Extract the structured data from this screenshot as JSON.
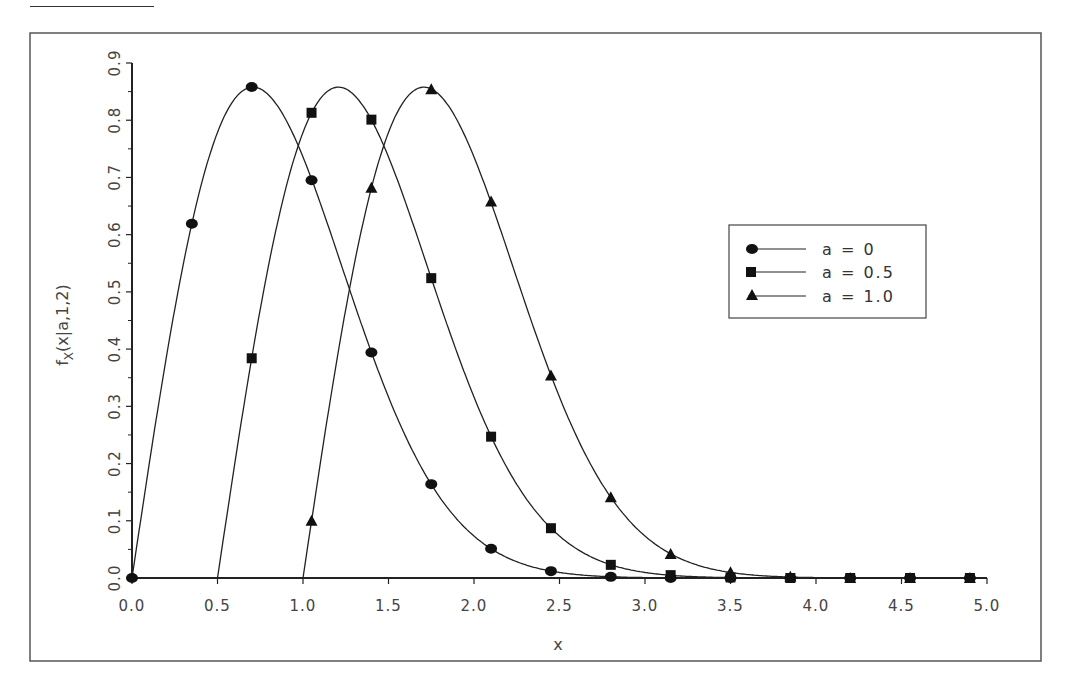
{
  "page": {
    "top_fragments": [
      "g",
      "g",
      "p"
    ]
  },
  "chart_data": {
    "type": "line",
    "title": "",
    "xlabel": "x",
    "ylabel": "f_X(x|a,1,2)",
    "ylabel_main": "f",
    "ylabel_sub": "X",
    "ylabel_rest": "(x|a,1,2)",
    "xlim": [
      0.0,
      5.0
    ],
    "ylim": [
      0.0,
      0.9
    ],
    "xticks": [
      "0.0",
      "0.5",
      "1.0",
      "1.5",
      "2.0",
      "2.5",
      "3.0",
      "3.5",
      "4.0",
      "4.5",
      "5.0"
    ],
    "yticks": [
      "0.0",
      "0.1",
      "0.2",
      "0.3",
      "0.4",
      "0.5",
      "0.6",
      "0.7",
      "0.8",
      "0.9"
    ],
    "grid": false,
    "legend_position": "right-center",
    "x": [
      0.0,
      0.35,
      0.7,
      1.05,
      1.4,
      1.75,
      2.1,
      2.45,
      2.8,
      3.15,
      3.5,
      3.85,
      4.2,
      4.55,
      4.9
    ],
    "series": [
      {
        "name": "a = 0",
        "marker": "circle",
        "a": 0.0,
        "values": [
          0.0,
          0.619,
          0.858,
          0.695,
          0.394,
          0.164,
          0.051,
          0.012,
          0.002,
          0.0,
          0.0,
          0.0,
          0.0,
          0.0,
          0.0
        ]
      },
      {
        "name": "a = 0.5",
        "marker": "square",
        "a": 0.5,
        "values": [
          null,
          null,
          0.384,
          0.813,
          0.801,
          0.524,
          0.247,
          0.087,
          0.023,
          0.005,
          0.001,
          0.0,
          0.0,
          0.0,
          0.0
        ]
      },
      {
        "name": "a = 1.0",
        "marker": "triangle",
        "a": 1.0,
        "values": [
          null,
          null,
          null,
          0.1,
          0.682,
          0.854,
          0.658,
          0.354,
          0.141,
          0.042,
          0.01,
          0.002,
          0.0,
          0.0,
          0.0
        ]
      }
    ],
    "colors": {
      "line": "#222222",
      "marker": "#111111",
      "axis": "#222222",
      "frame": "#555555"
    }
  }
}
